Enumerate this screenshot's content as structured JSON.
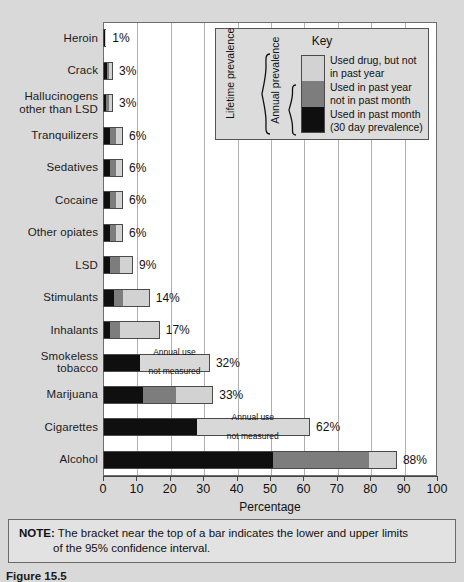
{
  "chart_data": {
    "type": "bar",
    "orientation": "horizontal",
    "stacked": true,
    "title": "",
    "xlabel": "Percentage",
    "ylabel": "",
    "xlim": [
      0,
      100
    ],
    "xticks": [
      0,
      10,
      20,
      30,
      40,
      50,
      60,
      70,
      80,
      90,
      100
    ],
    "grid": true,
    "legend_position": "inside-top-right",
    "categories": [
      "Heroin",
      "Crack",
      "Hallucinogens other than LSD",
      "Tranquilizers",
      "Sedatives",
      "Cocaine",
      "Other opiates",
      "LSD",
      "Stimulants",
      "Inhalants",
      "Smokeless tobacco",
      "Marijuana",
      "Cigarettes",
      "Alcohol"
    ],
    "series": [
      {
        "name": "Used in past month (30 day prevalence)",
        "color": "#100f0f",
        "values": [
          0.5,
          1,
          0.8,
          2,
          2,
          2,
          2,
          2,
          3,
          2,
          11,
          12,
          28,
          51
        ]
      },
      {
        "name": "Used in past year not in past month",
        "color": "#7d7d7d",
        "values": [
          0.3,
          1,
          1.2,
          2,
          2,
          2,
          2,
          3,
          3,
          3,
          null,
          10,
          null,
          29
        ]
      },
      {
        "name": "Used drug, but not in past year",
        "color": "#d2d2d2",
        "values": [
          0.2,
          1,
          1,
          2,
          2,
          2,
          2,
          4,
          8,
          12,
          21,
          11,
          34,
          8
        ]
      }
    ],
    "totals": [
      1,
      3,
      3,
      6,
      6,
      6,
      6,
      9,
      14,
      17,
      32,
      33,
      62,
      88
    ],
    "total_labels": [
      "1%",
      "3%",
      "3%",
      "6%",
      "6%",
      "6%",
      "6%",
      "9%",
      "14%",
      "17%",
      "32%",
      "33%",
      "62%",
      "88%"
    ],
    "not_measured_label": [
      "Annual use",
      "not measured"
    ],
    "not_measured_rows": [
      "Smokeless tobacco",
      "Cigarettes"
    ]
  },
  "legend": {
    "title": "Key",
    "entries": [
      {
        "label": "Used drug, but not in past year",
        "color": "#d2d2d2"
      },
      {
        "label": "Used in past year not in past month",
        "color": "#7d7d7d"
      },
      {
        "label": "Used in past month (30 day prevalence)",
        "color": "#100f0f"
      }
    ],
    "bracket_lifetime": "Lifetime prevalence",
    "bracket_annual": "Annual prevalence"
  },
  "note": {
    "prefix": "NOTE:",
    "line1": "The bracket near the top of a bar indicates the lower and upper limits",
    "line2": "of the 95% confidence interval."
  },
  "caption": {
    "text": "Figure 15.5"
  },
  "colors": {
    "background": "#d9d9d9",
    "plot_background": "#ffffff",
    "gridline": "#b0b0b0",
    "axis": "#444444",
    "legend_background": "#dcdcdc",
    "note_background": "#e2e2e2"
  }
}
